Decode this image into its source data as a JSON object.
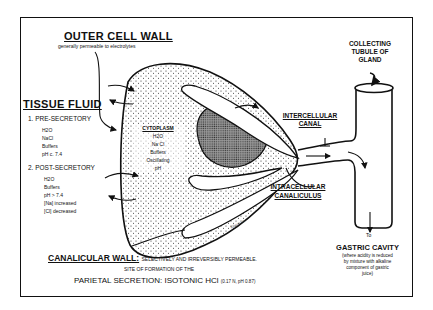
{
  "outer_cell_wall": {
    "title": "OUTER CELL WALL",
    "subtitle": "generally permeable to electrolytes"
  },
  "tissue_fluid": {
    "title": "TISSUE FLUID",
    "pre_secretory": {
      "heading": "1. PRE-SECRETORY",
      "items": [
        "H2O",
        "NaCl",
        "Buffers",
        "pH c. 7.4"
      ]
    },
    "post_secretory": {
      "heading": "2. POST-SECRETORY",
      "items": [
        "H2O",
        "Buffers",
        "pH > 7.4",
        "[Na] increased",
        "[Cl] decreased"
      ]
    }
  },
  "cytoplasm": {
    "title": "CYTOPLASM",
    "items": [
      "H2O",
      "Na Cl",
      "Buffers",
      "Oscillating",
      "pH"
    ]
  },
  "collecting_tubule": {
    "lines": [
      "COLLECTING",
      "TUBULE OF",
      "GLAND"
    ]
  },
  "intercellular_canal": {
    "lines": [
      "INTERCELLULAR",
      "CANAL"
    ]
  },
  "intracellular_canaliculus": {
    "lines": [
      "INTRACELLULAR",
      "CANALICULUS"
    ]
  },
  "gastric_cavity": {
    "to_label": "To",
    "title": "GASTRIC CAVITY",
    "lines": [
      "(where acidity is reduced",
      "by mixture with alkaline",
      "component of gastric",
      "juice)"
    ]
  },
  "canalicular_wall": {
    "title": "CANALICULAR WALL:",
    "description": "SELECTIVELY AND IRREVERSIBLY PERMEABLE.",
    "site_line": "SITE OF FORMATION OF THE",
    "secretion_title": "PARIETAL SECRETION: ISOTONIC HCl",
    "secretion_values": "(0.17 N, pH 0.87)"
  },
  "signature": "Kilgore, Jr."
}
